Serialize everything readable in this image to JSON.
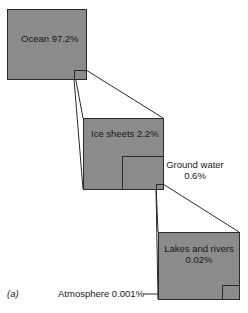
{
  "figure": {
    "panel_label": "(a)",
    "fill_color": "#8b8b8b",
    "line_color": "#2a2a2a",
    "levels": [
      {
        "name": "ocean",
        "label": "Ocean 97.2%",
        "percent": 97.2
      },
      {
        "name": "ice-sheets",
        "label": "Ice sheets 2.2%",
        "percent": 2.2
      },
      {
        "name": "ground-water",
        "label_line1": "Ground water",
        "label_line2": "0.6%",
        "percent": 0.6
      },
      {
        "name": "lakes-rivers",
        "label_line1": "Lakes and rivers",
        "label_line2": "0.02%",
        "percent": 0.02
      },
      {
        "name": "atmosphere",
        "label": "Atmosphere 0.001%",
        "percent": 0.001
      }
    ]
  }
}
